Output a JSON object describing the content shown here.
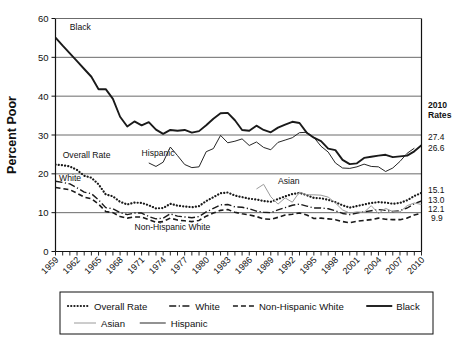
{
  "chart_data": {
    "type": "line",
    "title": "",
    "xlabel": "",
    "ylabel": "Percent Poor",
    "ylim": [
      0,
      60
    ],
    "ytick_values": [
      0,
      10,
      20,
      30,
      40,
      50,
      60
    ],
    "xlim": [
      1959,
      2010
    ],
    "xtick_labels": [
      "1959",
      "1962",
      "1965",
      "1968",
      "1971",
      "1974",
      "1977",
      "1980",
      "1983",
      "1986",
      "1989",
      "1992",
      "1995",
      "1998",
      "2001",
      "2004",
      "2007",
      "2010"
    ],
    "grid": "horizontal",
    "legend_position": "bottom",
    "series": [
      {
        "name": "Overall Rate",
        "style": "dotted",
        "color": "#1a1a1a",
        "x_start": 1959,
        "values": [
          22.4,
          22.2,
          21.9,
          21.0,
          19.5,
          19.0,
          17.3,
          14.7,
          14.2,
          12.8,
          12.1,
          12.6,
          12.5,
          11.9,
          11.1,
          11.2,
          12.3,
          11.8,
          11.6,
          11.4,
          11.7,
          13.0,
          14.0,
          15.0,
          15.2,
          14.4,
          14.0,
          13.6,
          13.4,
          13.0,
          12.8,
          13.5,
          14.2,
          14.8,
          15.1,
          14.5,
          13.8,
          13.7,
          13.3,
          12.7,
          11.9,
          11.3,
          11.7,
          12.1,
          12.5,
          12.7,
          12.6,
          12.3,
          12.5,
          13.2,
          14.3,
          15.1
        ]
      },
      {
        "name": "White",
        "style": "dashdot",
        "color": "#1a1a1a",
        "x_start": 1959,
        "values": [
          18.1,
          17.8,
          17.4,
          16.4,
          15.3,
          14.9,
          13.3,
          11.3,
          11.0,
          10.0,
          9.5,
          9.9,
          9.9,
          9.0,
          8.4,
          8.6,
          9.7,
          9.1,
          8.9,
          8.7,
          9.0,
          10.2,
          11.1,
          12.0,
          12.1,
          11.5,
          11.4,
          11.0,
          10.4,
          10.1,
          10.0,
          10.7,
          11.3,
          11.9,
          12.2,
          11.7,
          11.2,
          11.2,
          11.0,
          10.5,
          9.8,
          9.5,
          9.9,
          10.2,
          10.5,
          10.8,
          10.6,
          10.3,
          10.5,
          11.2,
          12.3,
          13.0
        ]
      },
      {
        "name": "Non-Hispanic White",
        "style": "dashed",
        "color": "#1a1a1a",
        "x_start": 1959,
        "values": [
          16.5,
          16.2,
          15.9,
          15.0,
          14.0,
          13.6,
          12.2,
          10.3,
          10.0,
          9.0,
          8.6,
          8.9,
          8.9,
          8.2,
          7.5,
          7.7,
          8.6,
          8.1,
          7.9,
          7.7,
          8.0,
          9.1,
          9.9,
          10.6,
          10.8,
          10.1,
          9.7,
          9.4,
          9.0,
          8.4,
          8.3,
          8.8,
          9.4,
          9.6,
          9.9,
          9.4,
          8.5,
          8.6,
          8.4,
          8.2,
          7.7,
          7.4,
          7.8,
          8.0,
          8.2,
          8.6,
          8.3,
          8.2,
          8.2,
          8.6,
          9.4,
          9.9
        ]
      },
      {
        "name": "Black",
        "style": "solid-thick",
        "color": "#1a1a1a",
        "x_start": 1959,
        "values": [
          55.1,
          53.0,
          51.0,
          49.0,
          47.0,
          45.0,
          41.8,
          41.8,
          39.3,
          34.7,
          32.2,
          33.5,
          32.5,
          33.3,
          31.4,
          30.3,
          31.3,
          31.1,
          31.3,
          30.6,
          31.0,
          32.5,
          34.2,
          35.6,
          35.7,
          33.8,
          31.3,
          31.1,
          32.4,
          31.3,
          30.7,
          31.9,
          32.7,
          33.4,
          33.1,
          30.6,
          29.3,
          28.4,
          26.5,
          26.1,
          23.6,
          22.5,
          22.7,
          24.1,
          24.4,
          24.7,
          24.9,
          24.3,
          24.5,
          24.7,
          25.8,
          27.4
        ]
      },
      {
        "name": "Asian",
        "style": "solid-thin-gray",
        "color": "#9a9a9a",
        "x_start": 1987,
        "values": [
          16.1,
          17.3,
          14.1,
          12.2,
          13.8,
          12.7,
          15.3,
          14.6,
          14.6,
          14.5,
          14.0,
          12.5,
          10.7,
          9.9,
          10.2,
          10.1,
          11.8,
          9.8,
          11.1,
          10.3,
          10.2,
          11.8,
          12.5,
          12.1
        ]
      },
      {
        "name": "Hispanic",
        "style": "solid-thin",
        "color": "#1a1a1a",
        "x_start": 1972,
        "values": [
          22.8,
          21.9,
          23.0,
          26.9,
          24.7,
          22.4,
          21.6,
          21.8,
          25.7,
          26.5,
          29.9,
          28.0,
          28.4,
          29.0,
          27.3,
          28.2,
          26.8,
          26.2,
          28.1,
          28.7,
          29.3,
          30.6,
          30.7,
          29.4,
          27.1,
          25.6,
          22.8,
          21.5,
          21.4,
          21.8,
          22.5,
          21.9,
          21.8,
          20.6,
          21.5,
          23.2,
          25.3,
          26.6
        ]
      }
    ],
    "annotations": [
      {
        "text": "Black",
        "x": 1961,
        "y": 57
      },
      {
        "text": "Overall Rate",
        "x": 1960,
        "y": 24
      },
      {
        "text": "Hispanic",
        "x": 1971,
        "y": 24.5
      },
      {
        "text": "White",
        "x": 1959.5,
        "y": 18.2
      },
      {
        "text": "Non-Hispanic White",
        "x": 1970,
        "y": 5.5
      },
      {
        "text": "Asian",
        "x": 1990,
        "y": 17.4
      }
    ],
    "side_panel": {
      "header_line1": "2010",
      "header_line2": "Rates",
      "values": [
        {
          "label": "27.4",
          "series": "Black"
        },
        {
          "label": "26.6",
          "series": "Hispanic"
        },
        {
          "label": "15.1",
          "series": "Asian"
        },
        {
          "label": "13.0",
          "series": "Overall Rate"
        },
        {
          "label": "12.1",
          "series": "White"
        },
        {
          "label": "9.9",
          "series": "Non-Hispanic White"
        }
      ]
    },
    "legend": [
      {
        "label": "Overall Rate",
        "style": "dotted"
      },
      {
        "label": "White",
        "style": "dashdot"
      },
      {
        "label": "Non-Hispanic White",
        "style": "dashed"
      },
      {
        "label": "Black",
        "style": "solid-thick"
      },
      {
        "label": "Asian",
        "style": "solid-thin-gray"
      },
      {
        "label": "Hispanic",
        "style": "solid-thin"
      }
    ]
  }
}
